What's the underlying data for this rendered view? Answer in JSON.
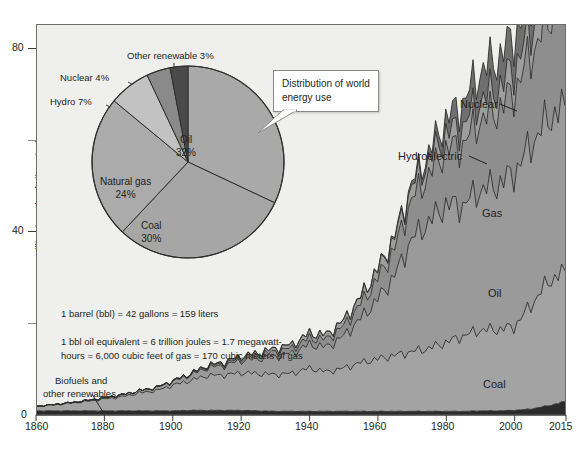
{
  "figure": {
    "background": "#ffffff",
    "plot_background": "#efefed",
    "frame_color": "#6d6d6d"
  },
  "axes": {
    "ylabel": "Billion barrels of oil equivalent",
    "y_ticks_major": [
      "0",
      "40",
      "80"
    ],
    "y_ticks_minor": [
      "20",
      "60"
    ],
    "x_ticks": [
      "1860",
      "1880",
      "1900",
      "1920",
      "1940",
      "1960",
      "1980",
      "2000",
      "2015"
    ]
  },
  "callout": {
    "line1": "Distribution of world",
    "line2": "energy use"
  },
  "notes": {
    "line1": "1 barrel (bbl) = 42 gallons = 159 liters",
    "line2": "1 bbl oil equivalent = 6 trillion joules = 1.7 megawatt-",
    "line3": "hours = 6,000 cubic feet of gas = 170 cubic meters of gas"
  },
  "biofuels_note": {
    "line1": "Biofuels and",
    "line2": "other renewables"
  },
  "band_labels": {
    "nuclear": "Nuclear",
    "hydroelectric": "Hydroelectric",
    "gas": "Gas",
    "oil": "Oil",
    "coal": "Coal"
  },
  "pie_labels": {
    "other_renewable": "Other renewable 3%",
    "nuclear": "Nuclear 4%",
    "hydro": "Hydro 7%",
    "oil_name": "Oil",
    "oil_pct": "32%",
    "coal_name": "Coal",
    "coal_pct": "30%",
    "gas_name": "Natural gas",
    "gas_pct": "24%"
  },
  "chart_data": {
    "type": "area",
    "xlabel": "",
    "ylabel": "Billion barrels of oil equivalent",
    "xlim": [
      1860,
      2015
    ],
    "ylim": [
      0,
      85
    ],
    "grid": false,
    "legend": "inline band labels",
    "stacked": true,
    "x": [
      1860,
      1865,
      1870,
      1875,
      1880,
      1885,
      1890,
      1895,
      1900,
      1905,
      1910,
      1915,
      1920,
      1925,
      1930,
      1935,
      1940,
      1945,
      1950,
      1955,
      1960,
      1965,
      1970,
      1975,
      1980,
      1985,
      1990,
      1995,
      2000,
      2005,
      2010,
      2015
    ],
    "series": [
      {
        "name": "Biofuels and other renewables",
        "color": "#2b2b2b",
        "values": [
          0.9,
          0.9,
          0.9,
          0.9,
          0.9,
          0.9,
          0.9,
          0.9,
          0.9,
          1.0,
          1.0,
          1.0,
          1.0,
          0.9,
          0.8,
          0.8,
          0.8,
          0.8,
          0.8,
          0.8,
          0.8,
          0.8,
          0.8,
          0.8,
          0.8,
          0.8,
          0.9,
          0.9,
          1.0,
          1.3,
          2.0,
          2.9
        ]
      },
      {
        "name": "Coal",
        "color": "#a3a3a3",
        "values": [
          1.0,
          1.3,
          1.7,
          2.1,
          2.6,
          3.1,
          3.9,
          4.4,
          5.6,
          6.5,
          7.6,
          7.7,
          8.2,
          8.1,
          8.0,
          8.3,
          9.4,
          8.6,
          9.4,
          10.6,
          11.4,
          12.2,
          13.0,
          13.7,
          15.0,
          16.4,
          17.6,
          17.7,
          18.2,
          22.6,
          27.0,
          28.5
        ]
      },
      {
        "name": "Oil",
        "color": "#9a9a9a",
        "values": [
          0.0,
          0.1,
          0.1,
          0.2,
          0.3,
          0.4,
          0.5,
          0.6,
          0.8,
          1.2,
          1.7,
          2.1,
          2.7,
          3.3,
          4.0,
          4.4,
          5.2,
          5.4,
          7.0,
          9.6,
          13.0,
          17.4,
          24.5,
          27.5,
          30.0,
          28.5,
          30.5,
          31.5,
          33.5,
          35.0,
          35.5,
          36.0
        ]
      },
      {
        "name": "Gas",
        "color": "#8e8e8e",
        "values": [
          0.0,
          0.0,
          0.0,
          0.0,
          0.0,
          0.0,
          0.0,
          0.1,
          0.1,
          0.2,
          0.3,
          0.4,
          0.5,
          0.7,
          1.0,
          1.1,
          1.4,
          1.7,
          2.2,
          3.2,
          4.5,
          6.0,
          8.6,
          10.3,
          12.0,
          13.3,
          15.2,
          16.2,
          17.8,
          19.6,
          21.8,
          23.5
        ]
      },
      {
        "name": "Hydroelectric",
        "color": "#9e9e9e",
        "values": [
          0.0,
          0.0,
          0.0,
          0.0,
          0.0,
          0.0,
          0.0,
          0.0,
          0.1,
          0.1,
          0.2,
          0.3,
          0.4,
          0.5,
          0.7,
          0.8,
          1.0,
          1.0,
          1.2,
          1.5,
          1.9,
          2.3,
          2.8,
          3.2,
          3.6,
          4.0,
          4.4,
          4.7,
          5.1,
          5.5,
          6.2,
          6.8
        ]
      },
      {
        "name": "Nuclear",
        "color": "#6f6f6f",
        "values": [
          0.0,
          0.0,
          0.0,
          0.0,
          0.0,
          0.0,
          0.0,
          0.0,
          0.0,
          0.0,
          0.0,
          0.0,
          0.0,
          0.0,
          0.0,
          0.0,
          0.0,
          0.0,
          0.0,
          0.1,
          0.2,
          0.4,
          0.8,
          1.6,
          3.0,
          5.0,
          6.2,
          6.6,
          6.8,
          6.9,
          6.6,
          6.3
        ]
      }
    ]
  },
  "pie_chart": {
    "type": "pie",
    "title": "Distribution of world energy use",
    "labels": [
      "Oil",
      "Coal",
      "Natural gas",
      "Hydro",
      "Nuclear",
      "Other renewable"
    ],
    "values": [
      32,
      30,
      24,
      7,
      4,
      3
    ],
    "colors": [
      "#a9a9a9",
      "#a6a6a6",
      "#ababab",
      "#c2c2c2",
      "#8a8a8a",
      "#4a4a4a"
    ]
  }
}
